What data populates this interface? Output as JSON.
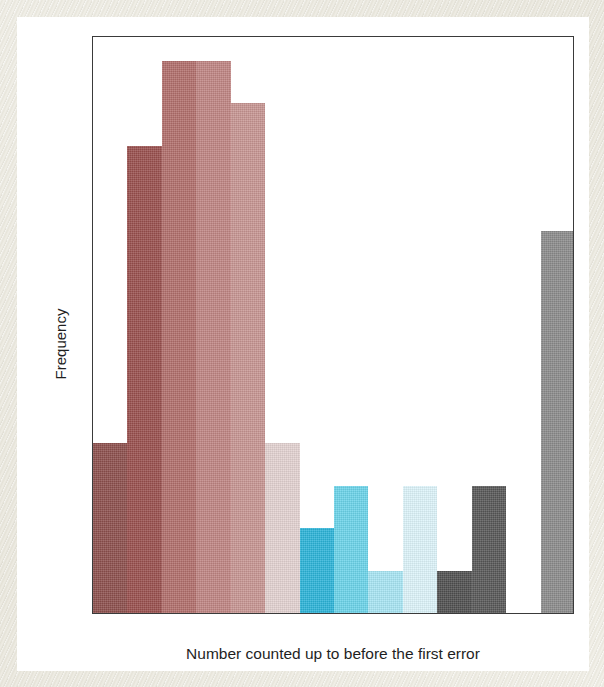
{
  "chart_data": {
    "type": "bar",
    "title": "",
    "subtitle": "",
    "xlabel": "Number counted up to before the first error",
    "ylabel": "Frequency",
    "grid": false,
    "legend": "none",
    "bin_width": 5,
    "xlim": [
      0,
      70
    ],
    "ylim": [
      0,
      13.6
    ],
    "x_ticks": [
      "0.00",
      "5.00",
      "10.00",
      "15.00",
      "20.00",
      "25.00",
      "30.00",
      "35.00",
      "40.00",
      "45.00",
      "50.00",
      "55.00",
      "60.00",
      "65.00",
      "70.00"
    ],
    "x_tick_values": [
      0,
      5,
      10,
      15,
      20,
      25,
      30,
      35,
      40,
      45,
      50,
      55,
      60,
      65,
      70
    ],
    "y_ticks": [
      "0.0",
      "2.5",
      "5.0",
      "7.5",
      "10.0",
      "12.5"
    ],
    "y_tick_values": [
      0,
      2.5,
      5,
      7.5,
      10,
      12.5
    ],
    "categories": [
      "0-5",
      "5-10",
      "10-15",
      "15-20",
      "20-25",
      "25-30",
      "30-35",
      "35-40",
      "40-45",
      "45-50",
      "50-55",
      "55-60",
      "60-65",
      "65-70"
    ],
    "values": [
      4,
      11,
      13,
      13,
      12,
      4,
      2,
      3,
      1,
      3,
      1,
      3,
      0,
      9
    ],
    "bins": [
      {
        "bin_start": 0,
        "bin_end": 5,
        "frequency": 4,
        "color": "#8d4f4c"
      },
      {
        "bin_start": 5,
        "bin_end": 10,
        "frequency": 11,
        "color": "#994f4d"
      },
      {
        "bin_start": 10,
        "bin_end": 15,
        "frequency": 13,
        "color": "#b16e6b"
      },
      {
        "bin_start": 15,
        "bin_end": 20,
        "frequency": 13,
        "color": "#bf8482"
      },
      {
        "bin_start": 20,
        "bin_end": 25,
        "frequency": 12,
        "color": "#c79592"
      },
      {
        "bin_start": 25,
        "bin_end": 30,
        "frequency": 4,
        "color": "#e3d2d1"
      },
      {
        "bin_start": 30,
        "bin_end": 35,
        "frequency": 2,
        "color": "#2bb4d8"
      },
      {
        "bin_start": 35,
        "bin_end": 40,
        "frequency": 3,
        "color": "#6bd4ea"
      },
      {
        "bin_start": 40,
        "bin_end": 45,
        "frequency": 1,
        "color": "#a8e6f4"
      },
      {
        "bin_start": 45,
        "bin_end": 50,
        "frequency": 3,
        "color": "#ddf4fa"
      },
      {
        "bin_start": 50,
        "bin_end": 55,
        "frequency": 1,
        "color": "#4f4f4f"
      },
      {
        "bin_start": 55,
        "bin_end": 60,
        "frequency": 3,
        "color": "#575757"
      },
      {
        "bin_start": 60,
        "bin_end": 65,
        "frequency": 0,
        "color": "#ffffff"
      },
      {
        "bin_start": 65,
        "bin_end": 70,
        "frequency": 9,
        "color": "#8b8b8b"
      }
    ]
  },
  "colors": {
    "axis": "#3a3a3a",
    "text": "#1f1f1f",
    "plot_background": "#ffffff",
    "page_background": "#eeece6"
  }
}
